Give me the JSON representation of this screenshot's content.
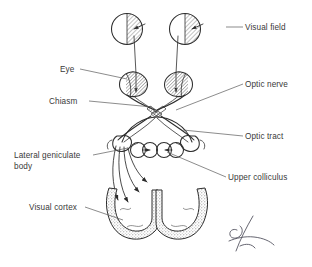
{
  "figure": {
    "background_color": "#ffffff",
    "ink_color": "#2e2e2e",
    "label_color": "#3a3a3a",
    "leader_color": "#5a5a5a",
    "hatch_fill_color": "#b8b8b8",
    "stipple_fill_color": "#cfcfcf",
    "signature_color": "#4a4a57"
  },
  "labels": [
    {
      "id": "visual-field",
      "text": "Visual field",
      "x": 245,
      "y": 30,
      "anchor": "start",
      "leader": "M 226 27 L 243 27"
    },
    {
      "id": "eye",
      "text": "Eye",
      "x": 60,
      "y": 72,
      "anchor": "start",
      "leader": "M 80 69 L 127 79"
    },
    {
      "id": "chiasm",
      "text": "Chiasm",
      "x": 49,
      "y": 104,
      "anchor": "start",
      "leader": "M 89 101 L 152 107"
    },
    {
      "id": "optic-nerve",
      "text": "Optic nerve",
      "x": 245,
      "y": 87,
      "anchor": "start",
      "leader": "M 176 110 L 243 84"
    },
    {
      "id": "optic-tract",
      "text": "Optic tract",
      "x": 245,
      "y": 139,
      "anchor": "start",
      "leader": "M 183 130 L 243 136"
    },
    {
      "id": "lateral-geniculate-body",
      "text": "Lateral geniculate",
      "text_line2": "body",
      "x": 14,
      "y": 158,
      "y2": 169,
      "anchor": "start",
      "leader": "M 93 155 L 128 148"
    },
    {
      "id": "upper-colliculus",
      "text": "Upper colliculus",
      "x": 228,
      "y": 180,
      "anchor": "start",
      "leader": "M 167 152 L 226 177"
    },
    {
      "id": "visual-cortex",
      "text": "Visual cortex",
      "x": 29,
      "y": 210,
      "anchor": "start",
      "leader": "M 85 207 L 123 220"
    }
  ],
  "structures": [
    {
      "id": "visual-field-left",
      "name": "left visual field circle",
      "shaded_half": "right"
    },
    {
      "id": "visual-field-right",
      "name": "right visual field circle",
      "shaded_half": "right"
    },
    {
      "id": "eye-left",
      "name": "left eye",
      "shaded_region": "nasal-retina"
    },
    {
      "id": "eye-right",
      "name": "right eye",
      "shaded_region": "nasal-retina"
    },
    {
      "id": "optic-chiasm",
      "name": "optic chiasm"
    },
    {
      "id": "optic-tract-left",
      "name": "left optic tract"
    },
    {
      "id": "optic-tract-right",
      "name": "right optic tract"
    },
    {
      "id": "lgn-left",
      "name": "left lateral geniculate body"
    },
    {
      "id": "lgn-right",
      "name": "right lateral geniculate body"
    },
    {
      "id": "colliculus-left",
      "name": "left upper colliculus"
    },
    {
      "id": "colliculus-right",
      "name": "right upper colliculus"
    },
    {
      "id": "visual-cortex-left",
      "name": "left occipital visual cortex"
    },
    {
      "id": "visual-cortex-right",
      "name": "right occipital visual cortex"
    }
  ],
  "signature": {
    "present": true,
    "position": "bottom-right"
  }
}
